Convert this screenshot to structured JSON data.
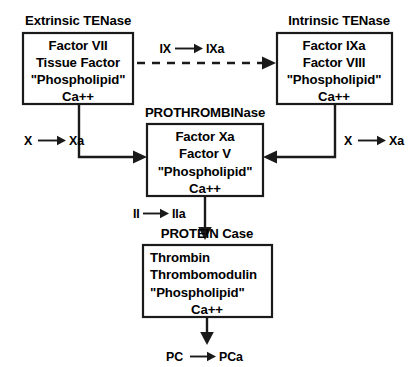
{
  "diagram": {
    "background_color": "#ffffff",
    "line_color": "#1a1a1a",
    "text_color": "#000000"
  },
  "complexes": {
    "extrinsic_tenase": {
      "title": "Extrinsic TENase",
      "components": [
        "Factor VII",
        "Tissue Factor",
        "\"Phospholipid\"",
        "Ca++"
      ]
    },
    "intrinsic_tenase": {
      "title": "Intrinsic TENase",
      "components": [
        "Factor IXa",
        "Factor VIII",
        "\"Phospholipid\"",
        "Ca++"
      ]
    },
    "prothrombinase": {
      "title": "PROTHROMBINase",
      "components": [
        "Factor Xa",
        "Factor V",
        "\"Phospholipid\"",
        "Ca++"
      ]
    },
    "protein_case": {
      "title": "PROTEIN Case",
      "components": [
        "Thrombin",
        "Thrombomodulin",
        "\"Phospholipid\"",
        "Ca++"
      ]
    }
  },
  "reactions": {
    "ix_to_ixa": {
      "substrate": "IX",
      "product": "IXa"
    },
    "x_to_xa_left": {
      "substrate": "X",
      "product": "Xa"
    },
    "x_to_xa_right": {
      "substrate": "X",
      "product": "Xa"
    },
    "ii_to_iia": {
      "substrate": "II",
      "product": "IIa"
    },
    "pc_to_pca": {
      "substrate": "PC",
      "product": "PCa"
    }
  }
}
